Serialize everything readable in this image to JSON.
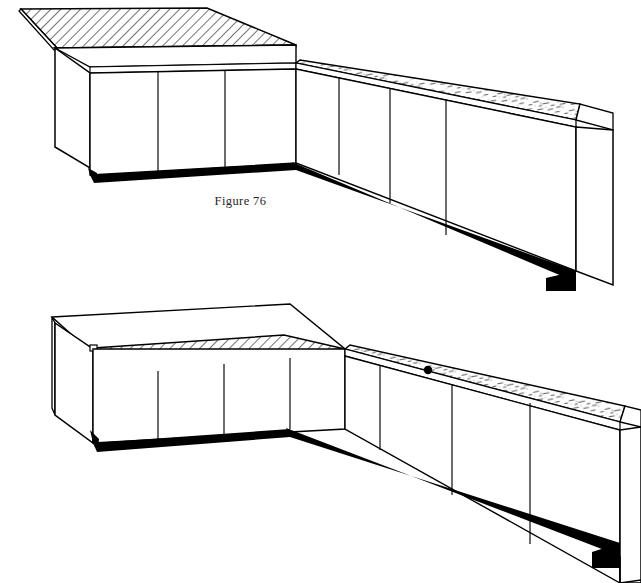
{
  "page": {
    "background_color": "#ffffff",
    "ink_color": "#000000",
    "document_type": "technical line illustration"
  },
  "figures": [
    {
      "id": "figure-76",
      "caption": "Figure 76",
      "description": "L-shaped base cabinet run shown in isometric view with the hatched countertop section lifted away above the left leg of the L",
      "parts": {
        "hatched_panel": {
          "name": "hatched-countertop-section",
          "state": "lifted above cabinets",
          "pattern": "diagonal hatch lines",
          "hatch_angle_deg": 45,
          "hatch_spacing_px": 5
        },
        "speckled_counter": {
          "name": "speckled-countertop-section",
          "state": "installed on right leg",
          "pattern": "mottled speckle / stipple"
        },
        "left_leg_doors": 3,
        "right_leg_doors": 3,
        "toe_kick": {
          "name": "toe-kick-shadow",
          "color": "#000000",
          "style": "solid black band along cabinet base"
        }
      }
    },
    {
      "id": "figure-77",
      "caption": "Figure 77",
      "description": "Same L-shaped base cabinet run with the hatched countertop section lowered into place on the left leg of the L",
      "parts": {
        "hatched_panel": {
          "name": "hatched-countertop-section",
          "state": "seated flat on cabinets",
          "pattern": "diagonal hatch lines",
          "hatch_angle_deg": 45,
          "hatch_spacing_px": 5
        },
        "speckled_counter": {
          "name": "speckled-countertop-section",
          "state": "installed on right leg",
          "pattern": "mottled speckle / stipple",
          "marker": {
            "name": "drill-hole-dot",
            "shape": "filled circle",
            "color": "#000000"
          }
        },
        "left_leg_doors": 3,
        "right_leg_doors": 3,
        "corner_notch": {
          "name": "alignment-notch",
          "location": "left end of hatched panel"
        },
        "toe_kick": {
          "name": "toe-kick-shadow",
          "color": "#000000",
          "style": "solid black band along cabinet base"
        }
      }
    }
  ]
}
